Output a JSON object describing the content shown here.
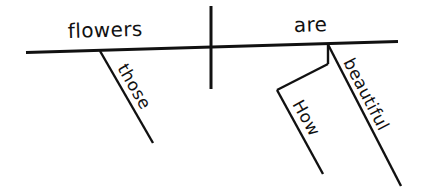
{
  "diagram": {
    "type": "sentence-diagram",
    "style": "Reed-Kellogg",
    "sentence": "How beautiful are those flowers",
    "background_color": "#ffffff",
    "line_color": "#111111",
    "labels": {
      "subject": "flowers",
      "verb": "are",
      "subject_modifier": "those",
      "predicate_adjective": "beautiful",
      "adverb_modifier": "How"
    },
    "geometry": {
      "baseline": {
        "x1": 26,
        "y1": 52.5,
        "x2": 398,
        "y2": 41.5,
        "width": 3
      },
      "divider": {
        "x1": 211,
        "y1": 6,
        "x2": 211,
        "y2": 89,
        "width": 3
      },
      "subject_modifier_line": {
        "x1": 100,
        "y1": 51,
        "x2": 153,
        "y2": 143,
        "width": 2.4
      },
      "predicate_adjective_line": {
        "x1": 328,
        "y1": 44.5,
        "x2": 401,
        "y2": 186,
        "width": 2.4
      },
      "adverb_stem_line": {
        "x1": 328,
        "y1": 44.5,
        "x2": 328,
        "y2": 64,
        "width": 2.4
      },
      "adverb_connector_line": {
        "x1": 328,
        "y1": 64,
        "x2": 277,
        "y2": 90,
        "width": 2.4
      },
      "adverb_modifier_line": {
        "x1": 277,
        "y1": 90,
        "x2": 323,
        "y2": 174,
        "width": 2.4
      }
    },
    "label_placement": {
      "subject": {
        "x": 68,
        "y": 38,
        "rotation": -1.7
      },
      "verb": {
        "x": 294,
        "y": 32,
        "rotation": -1.7
      },
      "subject_modifier": {
        "x": 117,
        "y": 68,
        "rotation": 60
      },
      "predicate_adjective": {
        "x": 343,
        "y": 62,
        "rotation": 62.5
      },
      "adverb_modifier": {
        "x": 292,
        "y": 104,
        "rotation": 61
      }
    }
  }
}
